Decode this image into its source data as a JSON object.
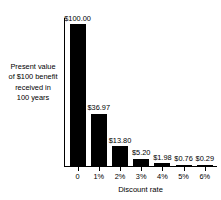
{
  "chart_data": {
    "type": "bar",
    "title": "",
    "subtitle": "",
    "categories": [
      "0",
      "1%",
      "2%",
      "3%",
      "4%",
      "5%",
      "6%"
    ],
    "values": [
      100.0,
      36.97,
      13.8,
      5.2,
      1.98,
      0.76,
      0.29
    ],
    "data_labels": [
      "$100.00",
      "$36.97",
      "$13.80",
      "$5.20",
      "$1.98",
      "$0.76",
      "$0.29"
    ],
    "xlabel": "Discount rate",
    "ylabel": "Present value of $100 benefit received in 100 years",
    "ylabel_lines": [
      "Present value",
      "of $100 benefit",
      "received in",
      "100 years"
    ],
    "ylim": [
      0,
      100
    ],
    "xlim_labels": [
      "0",
      "6%"
    ],
    "grid": false,
    "legend": null,
    "bar_color": "#000000",
    "background_color": "#ffffff",
    "axis_color": "#000000",
    "y_ticks_shown": false,
    "annotations": []
  }
}
